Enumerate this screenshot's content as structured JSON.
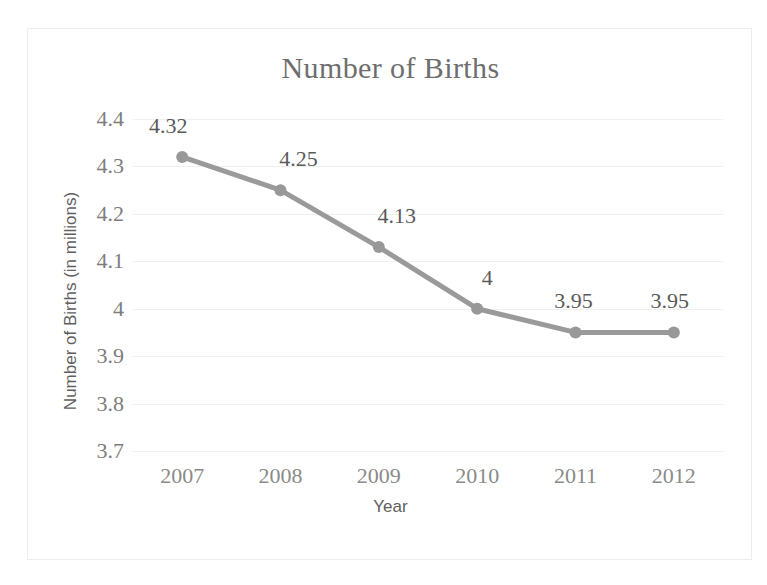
{
  "chart_data": {
    "type": "line",
    "title": "Number of Births",
    "xlabel": "Year",
    "ylabel": "Number of Births (in millions)",
    "categories": [
      "2007",
      "2008",
      "2009",
      "2010",
      "2011",
      "2012"
    ],
    "values": [
      4.32,
      4.25,
      4.13,
      4,
      3.95,
      3.95
    ],
    "data_labels": [
      "4.32",
      "4.25",
      "4.13",
      "4",
      "3.95",
      "3.95"
    ],
    "ylim": [
      3.7,
      4.4
    ],
    "y_ticks": [
      "4.4",
      "4.3",
      "4.2",
      "4.1",
      "4",
      "3.9",
      "3.8",
      "3.7"
    ],
    "y_tick_values": [
      4.4,
      4.3,
      4.2,
      4.1,
      4.0,
      3.9,
      3.8,
      3.7
    ],
    "grid": true,
    "legend": "none",
    "series": [
      {
        "name": "Number of Births",
        "values": [
          4.32,
          4.25,
          4.13,
          4,
          3.95,
          3.95
        ]
      }
    ],
    "colors": {
      "line": "#9a9a9a",
      "marker": "#989898",
      "gridline": "#f0f0f0",
      "title_text": "#6e6e6e",
      "axis_text": "#7d7d7d",
      "axis_title_text": "#5f5f5f",
      "data_label_text": "#5a5a5a",
      "border": "#ededed",
      "background": "#ffffff"
    }
  }
}
